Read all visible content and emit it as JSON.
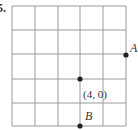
{
  "problem": {
    "number_label": "5."
  },
  "grid": {
    "columns": 5,
    "rows": 5,
    "x_lines": [
      12,
      35,
      58,
      80,
      103,
      126
    ],
    "y_lines": [
      6,
      30,
      54,
      79,
      103,
      126
    ],
    "line_color": "#9a9a9a",
    "border_color": "#9a9a9a"
  },
  "points": [
    {
      "id": "A",
      "label": "A",
      "x": 126,
      "y": 55,
      "label_x": 130,
      "label_y": 52
    },
    {
      "id": "center",
      "label": "(4, 0)",
      "x": 80,
      "y": 79,
      "label_x": 83,
      "label_y": 98
    },
    {
      "id": "B",
      "label": "B",
      "x": 80,
      "y": 126,
      "label_x": 85,
      "label_y": 120
    }
  ],
  "point_color": "#222222"
}
